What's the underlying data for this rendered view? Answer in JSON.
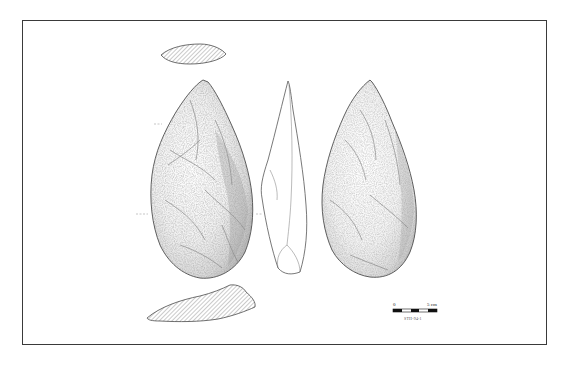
{
  "figure": {
    "type": "lithic illustration",
    "views": [
      {
        "name": "top-cross-section",
        "style": "hatched"
      },
      {
        "name": "dorsal-face",
        "style": "stippled shading"
      },
      {
        "name": "lateral-profile",
        "style": "outline"
      },
      {
        "name": "ventral-face",
        "style": "stippled shading"
      },
      {
        "name": "bottom-cross-section",
        "style": "hatched"
      }
    ],
    "colors": {
      "frame": "#3a3a3a",
      "outline": "#4a4a4a",
      "hatch": "#8a8a8a",
      "shade": "#6e6e6e",
      "background": "#ffffff"
    }
  },
  "scale_bar": {
    "start_label": "0",
    "end_label": "5 cm",
    "segments": 5,
    "specimen_label": "STH-94-1"
  }
}
